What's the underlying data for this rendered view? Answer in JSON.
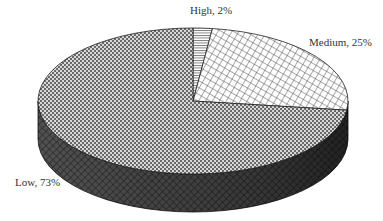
{
  "chart_data": {
    "type": "pie",
    "style": "3d",
    "title": "",
    "categories": [
      "High",
      "Medium",
      "Low"
    ],
    "values": [
      2,
      25,
      73
    ],
    "unit": "%",
    "labels": [
      "High, 2%",
      "Medium, 25%",
      "Low, 73%"
    ],
    "legend": "none",
    "start_angle_deg": 90,
    "direction": "clockwise",
    "patterns": {
      "High": "horizontal-lines",
      "Medium": "diagonal-crosshatch",
      "Low": "fine-checker"
    }
  }
}
